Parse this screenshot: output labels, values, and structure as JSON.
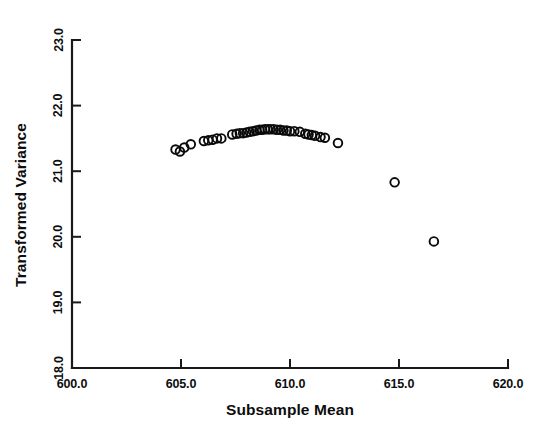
{
  "chart_data": {
    "type": "scatter",
    "title": "",
    "xlabel": "Subsample Mean",
    "ylabel": "Transformed Variance",
    "xlim": [
      600.0,
      620.0
    ],
    "ylim": [
      18.0,
      23.0
    ],
    "xticks": [
      "600.0",
      "605.0",
      "610.0",
      "615.0",
      "620.0"
    ],
    "yticks": [
      "18.0",
      "19.0",
      "20.0",
      "21.0",
      "22.0",
      "23.0"
    ],
    "xtick_values": [
      600.0,
      605.0,
      610.0,
      615.0,
      620.0
    ],
    "ytick_values": [
      18.0,
      19.0,
      20.0,
      21.0,
      22.0,
      23.0
    ],
    "grid": false,
    "legend": null,
    "marker": "open-circle",
    "marker_color": "#0a0a0a",
    "points": [
      {
        "x": 604.75,
        "y": 21.33
      },
      {
        "x": 604.95,
        "y": 21.3
      },
      {
        "x": 605.15,
        "y": 21.36
      },
      {
        "x": 605.45,
        "y": 21.41
      },
      {
        "x": 606.05,
        "y": 21.46
      },
      {
        "x": 606.25,
        "y": 21.47
      },
      {
        "x": 606.45,
        "y": 21.48
      },
      {
        "x": 606.65,
        "y": 21.5
      },
      {
        "x": 606.85,
        "y": 21.5
      },
      {
        "x": 607.35,
        "y": 21.56
      },
      {
        "x": 607.55,
        "y": 21.57
      },
      {
        "x": 607.7,
        "y": 21.58
      },
      {
        "x": 607.85,
        "y": 21.58
      },
      {
        "x": 608.0,
        "y": 21.59
      },
      {
        "x": 608.15,
        "y": 21.6
      },
      {
        "x": 608.3,
        "y": 21.61
      },
      {
        "x": 608.45,
        "y": 21.62
      },
      {
        "x": 608.6,
        "y": 21.63
      },
      {
        "x": 608.72,
        "y": 21.63
      },
      {
        "x": 608.85,
        "y": 21.64
      },
      {
        "x": 608.98,
        "y": 21.64
      },
      {
        "x": 609.1,
        "y": 21.64
      },
      {
        "x": 609.25,
        "y": 21.64
      },
      {
        "x": 609.4,
        "y": 21.63
      },
      {
        "x": 609.55,
        "y": 21.63
      },
      {
        "x": 609.7,
        "y": 21.62
      },
      {
        "x": 609.85,
        "y": 21.62
      },
      {
        "x": 610.0,
        "y": 21.61
      },
      {
        "x": 610.2,
        "y": 21.61
      },
      {
        "x": 610.45,
        "y": 21.6
      },
      {
        "x": 610.7,
        "y": 21.57
      },
      {
        "x": 610.85,
        "y": 21.56
      },
      {
        "x": 611.0,
        "y": 21.55
      },
      {
        "x": 611.15,
        "y": 21.54
      },
      {
        "x": 611.4,
        "y": 21.52
      },
      {
        "x": 611.6,
        "y": 21.51
      },
      {
        "x": 612.2,
        "y": 21.43
      },
      {
        "x": 614.8,
        "y": 20.83
      },
      {
        "x": 616.6,
        "y": 19.93
      }
    ]
  }
}
